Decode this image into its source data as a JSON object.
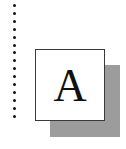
{
  "chapter_tile": {
    "letter": "A",
    "dot_count": 15,
    "colors": {
      "dots": "#111111",
      "tile_background": "#ffffff",
      "tile_border": "#3a3a3a",
      "shadow": "#9c9c9c",
      "letter": "#111111"
    }
  }
}
